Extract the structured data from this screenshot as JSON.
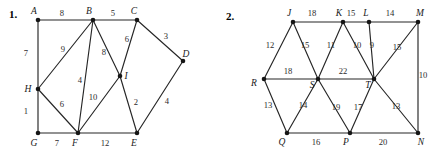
{
  "figures": [
    {
      "number": "1.",
      "number_pos": {
        "x": 9,
        "y": 18
      },
      "nodes": [
        {
          "id": "A",
          "x": 38,
          "y": 20,
          "lx": 34,
          "ly": 14
        },
        {
          "id": "B",
          "x": 93,
          "y": 20,
          "lx": 89,
          "ly": 14
        },
        {
          "id": "C",
          "x": 137,
          "y": 20,
          "lx": 134,
          "ly": 14
        },
        {
          "id": "D",
          "x": 183,
          "y": 61,
          "lx": 186,
          "ly": 57
        },
        {
          "id": "E",
          "x": 137,
          "y": 133,
          "lx": 134,
          "ly": 146
        },
        {
          "id": "F",
          "x": 78,
          "y": 133,
          "lx": 75,
          "ly": 146
        },
        {
          "id": "G",
          "x": 38,
          "y": 133,
          "lx": 34,
          "ly": 146
        },
        {
          "id": "H",
          "x": 38,
          "y": 89,
          "lx": 28,
          "ly": 92
        },
        {
          "id": "I",
          "x": 120,
          "y": 76,
          "lx": 126,
          "ly": 79
        }
      ],
      "edges": [
        {
          "from": "A",
          "to": "B",
          "weight": "8",
          "lx": 62,
          "ly": 16
        },
        {
          "from": "B",
          "to": "C",
          "weight": "5",
          "lx": 113,
          "ly": 16
        },
        {
          "from": "C",
          "to": "D",
          "weight": "3",
          "lx": 166,
          "ly": 39
        },
        {
          "from": "D",
          "to": "E",
          "weight": "4",
          "lx": 167,
          "ly": 104
        },
        {
          "from": "A",
          "to": "H",
          "weight": "7",
          "lx": 26,
          "ly": 56
        },
        {
          "from": "H",
          "to": "G",
          "weight": "1",
          "lx": 26,
          "ly": 114
        },
        {
          "from": "G",
          "to": "F",
          "weight": "7",
          "lx": 57,
          "ly": 146
        },
        {
          "from": "F",
          "to": "E",
          "weight": "12",
          "lx": 105,
          "ly": 146
        },
        {
          "from": "B",
          "to": "H",
          "weight": "9",
          "lx": 63,
          "ly": 52
        },
        {
          "from": "B",
          "to": "F",
          "weight": "4",
          "lx": 80,
          "ly": 83
        },
        {
          "from": "B",
          "to": "I",
          "weight": "8",
          "lx": 104,
          "ly": 55
        },
        {
          "from": "C",
          "to": "I",
          "weight": "6",
          "lx": 127,
          "ly": 42
        },
        {
          "from": "H",
          "to": "F",
          "weight": "6",
          "lx": 62,
          "ly": 107
        },
        {
          "from": "F",
          "to": "I",
          "weight": "10",
          "lx": 93,
          "ly": 100
        },
        {
          "from": "I",
          "to": "E",
          "weight": "2",
          "lx": 136,
          "ly": 105
        }
      ]
    },
    {
      "number": "2.",
      "number_pos": {
        "x": 8,
        "y": 20
      },
      "nodes": [
        {
          "id": "J",
          "x": 75,
          "y": 22,
          "lx": 71,
          "ly": 16
        },
        {
          "id": "K",
          "x": 125,
          "y": 22,
          "lx": 121,
          "ly": 16
        },
        {
          "id": "L",
          "x": 151,
          "y": 22,
          "lx": 148,
          "ly": 16
        },
        {
          "id": "M",
          "x": 200,
          "y": 22,
          "lx": 202,
          "ly": 16
        },
        {
          "id": "R",
          "x": 46,
          "y": 79,
          "lx": 36,
          "ly": 86
        },
        {
          "id": "S",
          "x": 100,
          "y": 79,
          "lx": 94,
          "ly": 88
        },
        {
          "id": "T",
          "x": 156,
          "y": 79,
          "lx": 150,
          "ly": 88
        },
        {
          "id": "Q",
          "x": 69,
          "y": 133,
          "lx": 64,
          "ly": 145
        },
        {
          "id": "P",
          "x": 132,
          "y": 133,
          "lx": 128,
          "ly": 145
        },
        {
          "id": "N",
          "x": 200,
          "y": 133,
          "lx": 203,
          "ly": 145
        }
      ],
      "edges": [
        {
          "from": "J",
          "to": "K",
          "weight": "18",
          "lx": 94,
          "ly": 16
        },
        {
          "from": "K",
          "to": "L",
          "weight": "15",
          "lx": 133,
          "ly": 16
        },
        {
          "from": "L",
          "to": "M",
          "weight": "14",
          "lx": 172,
          "ly": 16
        },
        {
          "from": "J",
          "to": "R",
          "weight": "12",
          "lx": 52,
          "ly": 48
        },
        {
          "from": "J",
          "to": "S",
          "weight": "15",
          "lx": 87,
          "ly": 48
        },
        {
          "from": "K",
          "to": "S",
          "weight": "11",
          "lx": 113,
          "ly": 48
        },
        {
          "from": "K",
          "to": "T",
          "weight": "10",
          "lx": 139,
          "ly": 48
        },
        {
          "from": "L",
          "to": "T",
          "weight": "9",
          "lx": 154,
          "ly": 48
        },
        {
          "from": "M",
          "to": "T",
          "weight": "15",
          "lx": 179,
          "ly": 50
        },
        {
          "from": "M",
          "to": "N",
          "weight": "10",
          "lx": 205,
          "ly": 78
        },
        {
          "from": "R",
          "to": "S",
          "weight": "18",
          "lx": 70,
          "ly": 74
        },
        {
          "from": "S",
          "to": "T",
          "weight": "22",
          "lx": 125,
          "ly": 74
        },
        {
          "from": "R",
          "to": "Q",
          "weight": "13",
          "lx": 50,
          "ly": 108
        },
        {
          "from": "S",
          "to": "Q",
          "weight": "14",
          "lx": 85,
          "ly": 108
        },
        {
          "from": "S",
          "to": "P",
          "weight": "19",
          "lx": 118,
          "ly": 110
        },
        {
          "from": "T",
          "to": "P",
          "weight": "17",
          "lx": 140,
          "ly": 110
        },
        {
          "from": "T",
          "to": "N",
          "weight": "13",
          "lx": 178,
          "ly": 109
        },
        {
          "from": "Q",
          "to": "P",
          "weight": "16",
          "lx": 98,
          "ly": 145
        },
        {
          "from": "P",
          "to": "N",
          "weight": "20",
          "lx": 165,
          "ly": 145
        }
      ]
    }
  ],
  "style": {
    "edge_color": "#262626",
    "node_color": "#161616",
    "text_color": "#1a1a1a",
    "background": "#ffffff"
  }
}
